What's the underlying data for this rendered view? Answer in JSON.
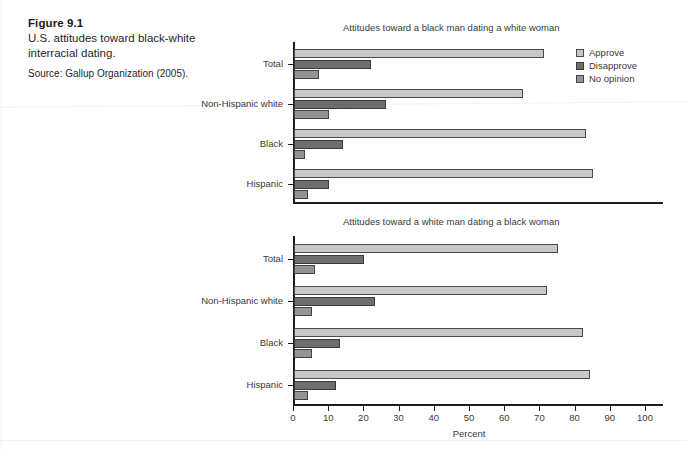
{
  "figure": {
    "number": "Figure 9.1",
    "caption": "U.S. attitudes toward black-white interracial dating.",
    "source": "Source: Gallup Organization (2005)."
  },
  "legend": {
    "position": "top-right",
    "items": [
      {
        "label": "Approve",
        "color": "#c8c8c8",
        "icon": "legend-swatch-icon"
      },
      {
        "label": "Disapprove",
        "color": "#6e6e6e",
        "icon": "legend-swatch-icon"
      },
      {
        "label": "No opinion",
        "color": "#949494",
        "icon": "legend-swatch-icon"
      }
    ]
  },
  "axis": {
    "xlabel": "Percent",
    "ticks": [
      "0",
      "10",
      "20",
      "30",
      "40",
      "50",
      "60",
      "70",
      "80",
      "90",
      "100"
    ],
    "xlim": [
      0,
      100
    ]
  },
  "chart_data": [
    {
      "type": "bar",
      "orientation": "horizontal",
      "title": "Attitudes toward a black man dating a white woman",
      "categories": [
        "Total",
        "Non-Hispanic white",
        "Black",
        "Hispanic"
      ],
      "series": [
        {
          "name": "Approve",
          "color": "#c8c8c8",
          "values": [
            71,
            65,
            83,
            85
          ]
        },
        {
          "name": "Disapprove",
          "color": "#6e6e6e",
          "values": [
            22,
            26,
            14,
            10
          ]
        },
        {
          "name": "No opinion",
          "color": "#949494",
          "values": [
            7,
            10,
            3,
            4
          ]
        }
      ],
      "xlabel": "Percent",
      "ylabel": "",
      "xlim": [
        0,
        100
      ],
      "grid": false,
      "legend": "top-right"
    },
    {
      "type": "bar",
      "orientation": "horizontal",
      "title": "Attitudes toward a white man dating a black woman",
      "categories": [
        "Total",
        "Non-Hispanic white",
        "Black",
        "Hispanic"
      ],
      "series": [
        {
          "name": "Approve",
          "color": "#c8c8c8",
          "values": [
            75,
            72,
            82,
            84
          ]
        },
        {
          "name": "Disapprove",
          "color": "#6e6e6e",
          "values": [
            20,
            23,
            13,
            12
          ]
        },
        {
          "name": "No opinion",
          "color": "#949494",
          "values": [
            6,
            5,
            5,
            4
          ]
        }
      ],
      "xlabel": "Percent",
      "ylabel": "",
      "xlim": [
        0,
        100
      ],
      "grid": false,
      "legend": "none"
    }
  ]
}
